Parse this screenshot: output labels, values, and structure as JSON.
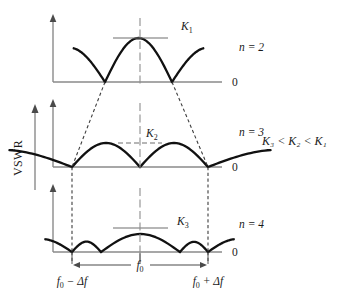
{
  "figure": {
    "type": "technical-line-diagram",
    "y_axis_label": "VSWR",
    "inequality": "K₃ < K₂ < K₁",
    "zero_label": "0",
    "colors": {
      "curve": "#111111",
      "axis": "#8a8a8a",
      "dashed": "#3d3d3d",
      "center_line": "#8e8e8e",
      "text": "#1a1a1a",
      "background": "#ffffff"
    }
  },
  "frequency_axis": {
    "left_label_base": "f",
    "left_label_sub": "0",
    "left_label_rest": " − Δf",
    "left_label_full": "f₀ − Δf",
    "center_label_base": "f",
    "center_label_sub": "0",
    "center_label_full": "f₀",
    "right_label_base": "f",
    "right_label_sub": "0",
    "right_label_rest": " + Δf",
    "right_label_full": "f₀ + Δf",
    "band_left_x": 72,
    "band_center_x": 140,
    "band_right_x": 208
  },
  "panels": [
    {
      "id": "panel-n2",
      "n_label": "n = 2",
      "n_value": 2,
      "k_label": "K",
      "k_sub": "1",
      "k_label_full": "K₁",
      "zero_label": "0",
      "baseline_y": 82,
      "axis_x": 53,
      "axis_top_y": 14,
      "axis_right_x": 222,
      "lobe_count_in_band": 1,
      "zeros_x": [
        105,
        172
      ],
      "peak_amplitude": 44,
      "k_tick_style": "solid",
      "k_tick_y": 38,
      "k_tick_x1": 113,
      "k_tick_x2": 168,
      "k_label_x": 181,
      "k_label_y": 30,
      "n_label_x": 239,
      "n_label_y": 51,
      "zero_label_x": 232,
      "zero_label_y": 86
    },
    {
      "id": "panel-n3",
      "n_label": "n = 3",
      "n_value": 3,
      "k_label": "K",
      "k_sub": "2",
      "k_label_full": "K₂",
      "zero_label": "0",
      "baseline_y": 167,
      "axis_x": 53,
      "axis_top_y": 99,
      "axis_right_x": 222,
      "lobe_count_in_band": 2,
      "zeros_x": [
        72,
        140,
        208
      ],
      "peak_amplitude": 24,
      "k_tick_style": "dashed",
      "k_tick_y": 143,
      "k_tick_x1": 118,
      "k_tick_x2": 162,
      "k_label_x": 146,
      "k_label_y": 137,
      "n_label_x": 239,
      "n_label_y": 136,
      "zero_label_x": 232,
      "zero_label_y": 171
    },
    {
      "id": "panel-n4",
      "n_label": "n = 4",
      "n_value": 4,
      "k_label": "K",
      "k_sub": "3",
      "k_label_full": "K₃",
      "zero_label": "0",
      "baseline_y": 252,
      "axis_x": 53,
      "axis_top_y": 184,
      "axis_right_x": 222,
      "lobe_count_in_band": 3,
      "zeros_x": [
        72,
        101,
        180,
        208
      ],
      "peak_amplitude": 18,
      "k_tick_style": "solid",
      "k_tick_y": 228,
      "k_tick_x1": 113,
      "k_tick_x2": 168,
      "k_label_x": 177,
      "k_label_y": 225,
      "n_label_x": 239,
      "n_label_y": 228,
      "zero_label_x": 232,
      "zero_label_y": 256
    }
  ],
  "inequality_position": {
    "x": 262,
    "y": 141
  },
  "vswr_position": {
    "x": 22,
    "y": 155
  }
}
